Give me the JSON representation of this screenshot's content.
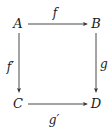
{
  "diagram": {
    "type": "commutative-square",
    "nodes": [
      {
        "id": "A",
        "label": "A",
        "x": 18,
        "y": 28
      },
      {
        "id": "B",
        "label": "B",
        "x": 96,
        "y": 28
      },
      {
        "id": "C",
        "label": "C",
        "x": 18,
        "y": 108
      },
      {
        "id": "D",
        "label": "D",
        "x": 96,
        "y": 108
      }
    ],
    "edges": [
      {
        "id": "f",
        "from": "A",
        "to": "B",
        "label": "f"
      },
      {
        "id": "g",
        "from": "B",
        "to": "D",
        "label": "g"
      },
      {
        "id": "f_prime",
        "from": "A",
        "to": "C",
        "label": "f′"
      },
      {
        "id": "g_prime",
        "from": "C",
        "to": "D",
        "label": "g′"
      }
    ]
  }
}
